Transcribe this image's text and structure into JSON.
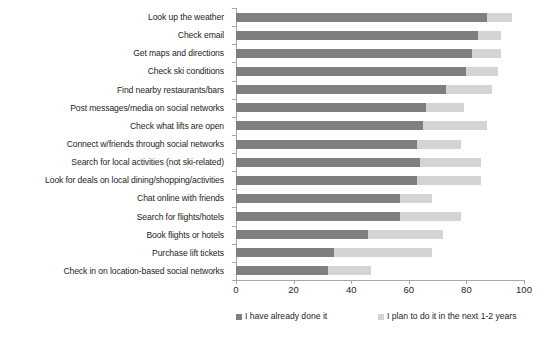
{
  "chart_data": {
    "type": "bar",
    "orientation": "horizontal",
    "stacked": true,
    "title": "",
    "subtitle": "",
    "xlabel": "",
    "ylabel": "",
    "xlim": [
      0,
      100
    ],
    "xticks": [
      0,
      20,
      40,
      60,
      80,
      100
    ],
    "grid": false,
    "legend_position": "bottom",
    "categories": [
      "Look up the weather",
      "Check email",
      "Get maps and directions",
      "Check ski conditions",
      "Find nearby restaurants/bars",
      "Post messages/media on social networks",
      "Check what lifts are open",
      "Connect w/friends through social networks",
      "Search for local activities (not ski-related)",
      "Look for deals on local dining/shopping/activities",
      "Chat online with friends",
      "Search for flights/hotels",
      "Book flights or hotels",
      "Purchase lift tickets",
      "Check in on location-based social networks"
    ],
    "series": [
      {
        "name": "I have already done it",
        "color": "#7f7f7f",
        "values": [
          87,
          84,
          82,
          80,
          73,
          66,
          65,
          63,
          64,
          63,
          57,
          57,
          46,
          34,
          32
        ]
      },
      {
        "name": "I plan to do it in the next 1-2 years",
        "color": "#d4d4d4",
        "values": [
          9,
          8,
          10,
          11,
          16,
          13,
          22,
          15,
          21,
          22,
          11,
          21,
          26,
          34,
          15
        ]
      }
    ],
    "totals": [
      96,
      92,
      92,
      91,
      89,
      79,
      87,
      78,
      85,
      85,
      68,
      78,
      72,
      68,
      47
    ]
  },
  "legend": {
    "items": [
      {
        "label": "I have already done it",
        "color": "#7f7f7f"
      },
      {
        "label": "I plan to do it in the next 1-2 years",
        "color": "#d4d4d4"
      }
    ]
  },
  "axis": {
    "tick_labels": [
      "0",
      "20",
      "40",
      "60",
      "80",
      "100"
    ]
  }
}
